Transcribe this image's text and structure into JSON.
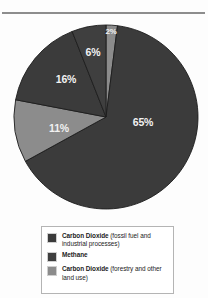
{
  "page": {
    "background_color": "#fdfdfd",
    "divider_color": "#8d8d8d"
  },
  "colors": {
    "dark": "#3b3b3b",
    "dark_alt": "#3f3f3f",
    "gray": "#8c8c8c",
    "label_text": "#f2f2f2",
    "legend_border": "#b4b4b4",
    "legend_text": "#1c1c1c"
  },
  "legend": {
    "items": [
      {
        "swatch_color": "#3b3b3b",
        "lead": "Carbon Dioxide",
        "detail": "(fossil fuel and industrial processes)"
      },
      {
        "swatch_color": "#3f3f3f",
        "lead": "Methane",
        "detail": ""
      },
      {
        "swatch_color": "#8c8c8c",
        "lead": "Carbon Dioxide",
        "detail": "(forestry and other land use)"
      }
    ]
  },
  "chart_data": {
    "type": "pie",
    "title": "",
    "subtitle": "",
    "xlabel": "",
    "ylabel": "",
    "legend_position": "bottom",
    "grid": false,
    "unit": "%",
    "start_angle_deg": 0,
    "direction": "clockwise",
    "categories": [
      "Carbon Dioxide (forestry and other land use)",
      "Carbon Dioxide (fossil fuel and industrial processes)",
      "Carbon Dioxide (forestry and other land use)",
      "Carbon Dioxide (fossil fuel and industrial processes)",
      "Methane"
    ],
    "values": [
      2,
      65,
      11,
      16,
      6
    ],
    "labels": [
      "2%",
      "65%",
      "11%",
      "16%",
      "6%"
    ],
    "slice_colors": [
      "#8c8c8c",
      "#3b3b3b",
      "#8c8c8c",
      "#3b3b3b",
      "#3f3f3f"
    ],
    "slices": [
      {
        "label": "2%",
        "value": 2,
        "color": "#8c8c8c",
        "label_x": 98,
        "label_y": 14
      },
      {
        "label": "65%",
        "value": 65,
        "color": "#3b3b3b",
        "label_x": 130,
        "label_y": 106
      },
      {
        "label": "11%",
        "value": 11,
        "color": "#8c8c8c",
        "label_x": 46,
        "label_y": 112
      },
      {
        "label": "16%",
        "value": 16,
        "color": "#3b3b3b",
        "label_x": 53,
        "label_y": 63
      },
      {
        "label": "6%",
        "value": 6,
        "color": "#3f3f3f",
        "label_x": 80,
        "label_y": 36
      }
    ]
  }
}
